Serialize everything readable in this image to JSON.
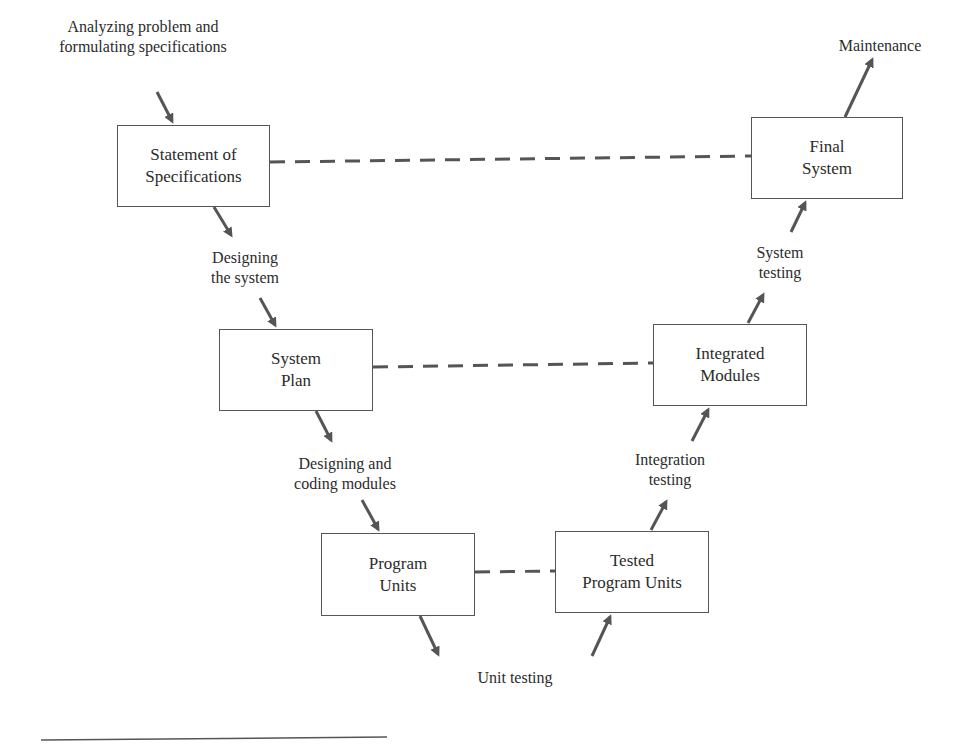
{
  "diagram": {
    "colors": {
      "line": "#555555",
      "arrow": "#555555",
      "text": "#2b2b2b",
      "background": "#ffffff"
    },
    "nodes": [
      {
        "id": "statement",
        "line1": "Statement of",
        "line2": "Specifications"
      },
      {
        "id": "system_plan",
        "line1": "System",
        "line2": "Plan"
      },
      {
        "id": "program_units",
        "line1": "Program",
        "line2": "Units"
      },
      {
        "id": "tested_units",
        "line1": "Tested",
        "line2": "Program Units"
      },
      {
        "id": "integrated",
        "line1": "Integrated",
        "line2": "Modules"
      },
      {
        "id": "final",
        "line1": "Final",
        "line2": "System"
      }
    ],
    "labels": {
      "analyzing": {
        "line1": "Analyzing problem and",
        "line2": "formulating specifications"
      },
      "designing_system": {
        "line1": "Designing",
        "line2": "the system"
      },
      "designing_coding": {
        "line1": "Designing and",
        "line2": "coding modules"
      },
      "unit_testing": {
        "line1": "Unit testing"
      },
      "integration_testing": {
        "line1": "Integration",
        "line2": "testing"
      },
      "system_testing": {
        "line1": "System",
        "line2": "testing"
      },
      "maintenance": {
        "line1": "Maintenance"
      }
    },
    "dashed_links": [
      {
        "from": "statement",
        "to": "final"
      },
      {
        "from": "system_plan",
        "to": "integrated"
      },
      {
        "from": "program_units",
        "to": "tested_units"
      }
    ]
  }
}
